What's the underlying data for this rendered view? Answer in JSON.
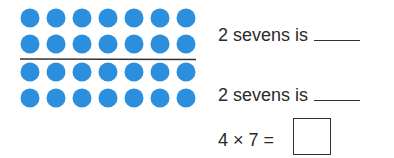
{
  "array": {
    "rows": 4,
    "columns": 7,
    "dividing_line_after_row": 2,
    "dot_color": "#2b8fdd",
    "line_color": "#333333"
  },
  "statements": [
    {
      "text": "2 sevens is",
      "answer": ""
    },
    {
      "text": "2 sevens is",
      "answer": ""
    }
  ],
  "equation": {
    "text": "4 × 7 =",
    "answer": ""
  }
}
